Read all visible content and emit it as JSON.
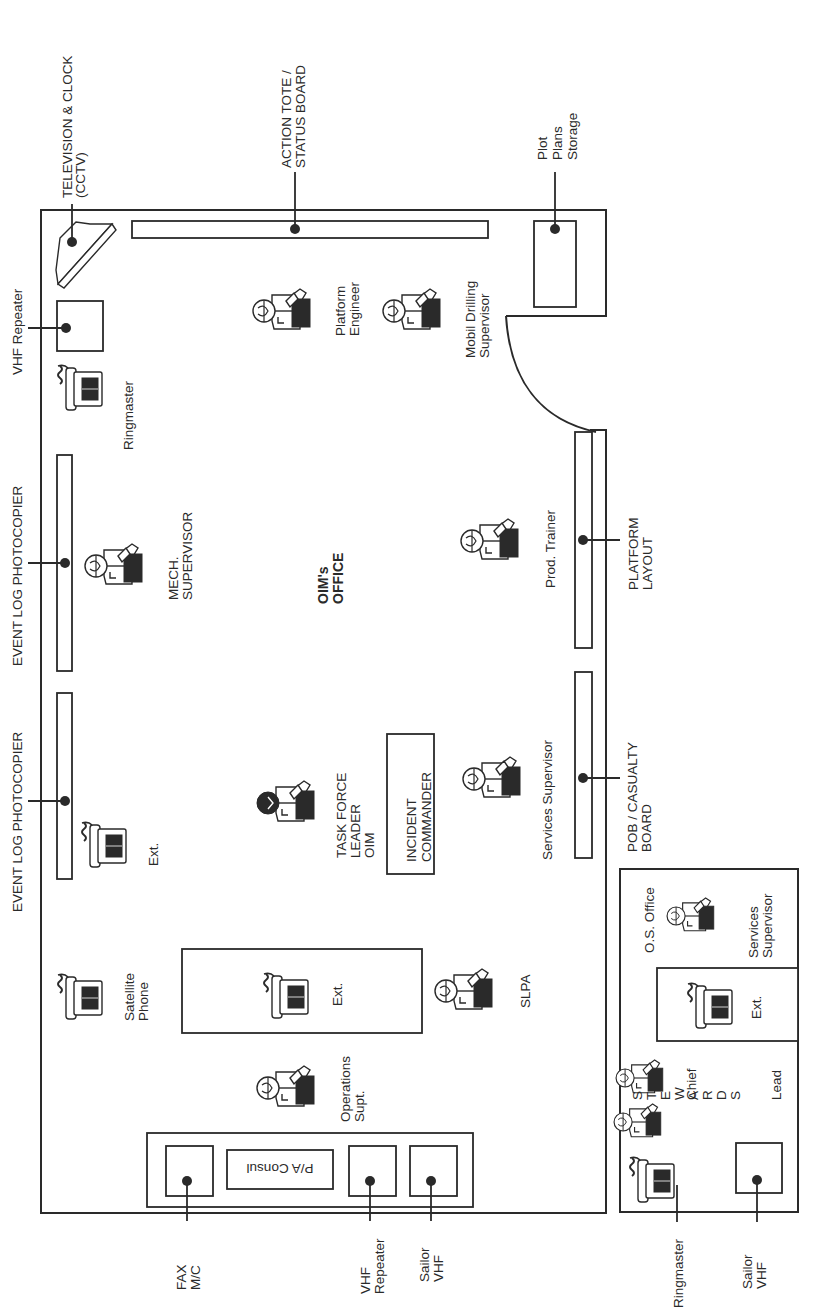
{
  "diagram": {
    "title_lines": [
      "OIM's",
      "OFFICE"
    ],
    "orientation": "rotated 90° counter-clockwise",
    "external_labels": {
      "television_clock": [
        "TELEVISION & CLOCK",
        "(CCTV)"
      ],
      "action_tote": [
        "ACTION TOTE /",
        "STATUS BOARD"
      ],
      "plot_plans": [
        "Plot",
        "Plans",
        "Storage"
      ],
      "vhf_repeater_top": [
        "VHF Repeater"
      ],
      "event_log_1": [
        "EVENT LOG PHOTOCOPIER"
      ],
      "event_log_2": [
        "EVENT LOG PHOTOCOPIER"
      ],
      "platform_layout": [
        "PLATFORM",
        "LAYOUT"
      ],
      "pob_board": [
        "POB / CASUALTY",
        "BOARD"
      ],
      "fax": [
        "FAX",
        "M/C"
      ],
      "vhf_repeater_bottom": [
        "VHF",
        "Repeater"
      ],
      "sailor_vhf_main": [
        "Sailor",
        "VHF"
      ],
      "ringmaster_os": [
        "Ringmaster"
      ],
      "sailor_vhf_os": [
        "Sailor",
        "VHF"
      ]
    },
    "people": [
      {
        "id": "platform-engineer",
        "label": [
          "Platform",
          "Engineer"
        ],
        "highlight": false
      },
      {
        "id": "mobil-drilling-supervisor",
        "label": [
          "Mobil Drilling",
          "Supervisor"
        ],
        "highlight": false
      },
      {
        "id": "mech-supervisor",
        "label": [
          "MECH.",
          "SUPERVISOR"
        ],
        "highlight": false
      },
      {
        "id": "prod-trainer",
        "label": [
          "Prod. Trainer"
        ],
        "highlight": false
      },
      {
        "id": "task-force-leader",
        "label": [
          "TASK FORCE",
          "LEADER",
          "OIM"
        ],
        "highlight": true
      },
      {
        "id": "services-supervisor",
        "label": [
          "Services Supervisor"
        ],
        "highlight": false
      },
      {
        "id": "slpa",
        "label": [
          "SLPA"
        ],
        "highlight": false
      },
      {
        "id": "operations-supt",
        "label": [
          "Operations",
          "Supt."
        ],
        "highlight": false
      },
      {
        "id": "os-services-supervisor",
        "label": [
          "Services",
          "Supervisor"
        ],
        "highlight": false
      },
      {
        "id": "steward-chief",
        "label": [
          "Chief"
        ],
        "highlight": false
      },
      {
        "id": "steward-lead",
        "label": [
          "Lead"
        ],
        "highlight": false
      }
    ],
    "phones": [
      {
        "id": "ringmaster-phone",
        "label": [
          "Ringmaster"
        ]
      },
      {
        "id": "ext-phone-1",
        "label": [
          "Ext."
        ]
      },
      {
        "id": "satellite-phone",
        "label": [
          "Satellite",
          "Phone"
        ]
      },
      {
        "id": "ext-phone-table",
        "label": [
          "Ext."
        ]
      },
      {
        "id": "ext-phone-os",
        "label": [
          "Ext."
        ]
      },
      {
        "id": "ringmaster-phone-os",
        "label": []
      }
    ],
    "boxes": {
      "incident_commander": [
        "INCIDENT",
        "COMMANDER"
      ],
      "pa_console": "P/A Consul"
    },
    "os_office": {
      "title": "O.S. Office",
      "stewards_letters": [
        "S",
        "T",
        "E",
        "W",
        "A",
        "R",
        "D",
        "S"
      ]
    }
  }
}
